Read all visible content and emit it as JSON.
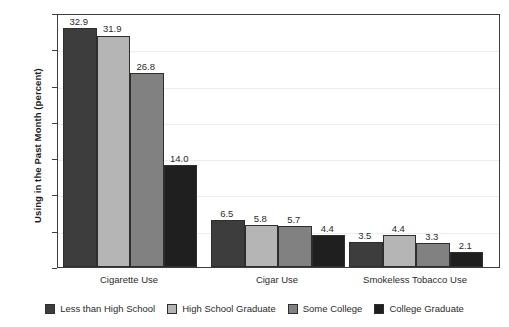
{
  "chart_data": {
    "type": "bar",
    "title": "",
    "xlabel": "",
    "ylabel": "Using in the Past Month (percent)",
    "ylim": [
      0,
      35
    ],
    "yticks": [
      0,
      5,
      10,
      15,
      20,
      25,
      30,
      35
    ],
    "grid": true,
    "legend_position": "bottom",
    "categories": [
      "Cigarette Use",
      "Cigar Use",
      "Smokeless Tobacco Use"
    ],
    "series": [
      {
        "name": "Less than High School",
        "color": "#3d3d3d",
        "values": [
          32.9,
          6.5,
          3.5
        ],
        "labels": [
          "32.9",
          "6.5",
          "3.5"
        ]
      },
      {
        "name": "High School Graduate",
        "color": "#b5b5b5",
        "values": [
          31.9,
          5.8,
          4.4
        ],
        "labels": [
          "31.9",
          "5.8",
          "4.4"
        ]
      },
      {
        "name": "Some College",
        "color": "#818181",
        "values": [
          26.8,
          5.7,
          3.3
        ],
        "labels": [
          "26.8",
          "5.7",
          "3.3"
        ]
      },
      {
        "name": "College Graduate",
        "color": "#1f1f1f",
        "values": [
          14.0,
          4.4,
          2.1
        ],
        "labels": [
          "14.0",
          "4.4",
          "2.1"
        ]
      }
    ]
  },
  "axis": {
    "y_title": "Using in the Past Month (percent)",
    "y_tick_labels": [
      "35",
      "30",
      "25",
      "20",
      "15",
      "10",
      "5",
      "0"
    ]
  },
  "colors": {
    "frame": "#3d3d3d",
    "grid": "#ededed",
    "background": "#ffffff",
    "text": "#2b2b2b"
  }
}
